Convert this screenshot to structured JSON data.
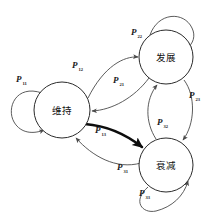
{
  "figure": {
    "kind": "state-transition-diagram",
    "background_color": "#ffffff",
    "stroke_color": "#4a4a4a",
    "bold_stroke_color": "#0d0d0d",
    "node_fill": "#ffffff",
    "node_stroke": "#2b2b2b"
  },
  "nodes": [
    {
      "id": "weichi",
      "label": "维持",
      "cx": 62,
      "cy": 110,
      "r": 28
    },
    {
      "id": "fazhan",
      "label": "发展",
      "cx": 166,
      "cy": 57,
      "r": 27
    },
    {
      "id": "shuaijian",
      "label": "衰减",
      "cx": 166,
      "cy": 165,
      "r": 27
    }
  ],
  "edge_labels": [
    {
      "id": "p11",
      "base": "P",
      "sub": "11",
      "x": 16,
      "y": 82,
      "from": "weichi",
      "to": "weichi"
    },
    {
      "id": "p12",
      "base": "P",
      "sub": "12",
      "x": 72,
      "y": 68,
      "from": "weichi",
      "to": "fazhan"
    },
    {
      "id": "p21",
      "base": "P",
      "sub": "21",
      "x": 113,
      "y": 83,
      "from": "fazhan",
      "to": "weichi"
    },
    {
      "id": "p22",
      "base": "P",
      "sub": "22",
      "x": 131,
      "y": 35,
      "from": "fazhan",
      "to": "fazhan"
    },
    {
      "id": "p23",
      "base": "P",
      "sub": "23",
      "x": 189,
      "y": 98,
      "from": "fazhan",
      "to": "shuaijian"
    },
    {
      "id": "p32",
      "base": "P",
      "sub": "32",
      "x": 157,
      "y": 125,
      "from": "shuaijian",
      "to": "fazhan"
    },
    {
      "id": "p13",
      "base": "P",
      "sub": "13",
      "x": 95,
      "y": 133,
      "from": "weichi",
      "to": "shuaijian"
    },
    {
      "id": "p31",
      "base": "P",
      "sub": "31",
      "x": 117,
      "y": 170,
      "from": "shuaijian",
      "to": "weichi"
    },
    {
      "id": "p33",
      "base": "P",
      "sub": "33",
      "x": 139,
      "y": 196,
      "from": "shuaijian",
      "to": "shuaijian"
    }
  ]
}
